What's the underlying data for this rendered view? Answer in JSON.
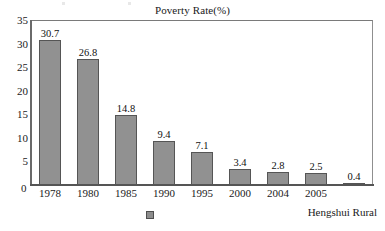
{
  "chart_data": {
    "type": "bar",
    "title": "Poverty Rate(%)",
    "xlabel": "",
    "ylabel": "",
    "categories": [
      "1978",
      "1980",
      "1985",
      "1990",
      "1995",
      "2000",
      "2004",
      "2005",
      ""
    ],
    "values": [
      30.7,
      26.8,
      14.8,
      9.4,
      7.1,
      3.4,
      2.8,
      2.5,
      0.4
    ],
    "value_labels": [
      "30.7",
      "26.8",
      "14.8",
      "9.4",
      "7.1",
      "3.4",
      "2.8",
      "2.5",
      "0.4"
    ],
    "ylim": [
      0,
      35
    ],
    "yticks": [
      0,
      5,
      10,
      15,
      20,
      25,
      30,
      35
    ],
    "ytick_labels": [
      "0",
      "5",
      "10",
      "15",
      "20",
      "25",
      "30",
      "35"
    ],
    "grid": false,
    "legend_position": "bottom",
    "series": [
      {
        "name": "Hengshui Rural",
        "values": [
          30.7,
          26.8,
          14.8,
          9.4,
          7.1,
          3.4,
          2.8,
          2.5,
          0.4
        ],
        "color": "#919191"
      }
    ]
  },
  "legend": {
    "marker_name": "legend-color-swatch",
    "label": "Hengshui Rural"
  },
  "axis": {
    "origin_label": "0"
  },
  "colors": {
    "bar_fill": "#919191",
    "bar_border": "#555555",
    "frame": "#8f8f8f",
    "text": "#1a1a1a"
  }
}
